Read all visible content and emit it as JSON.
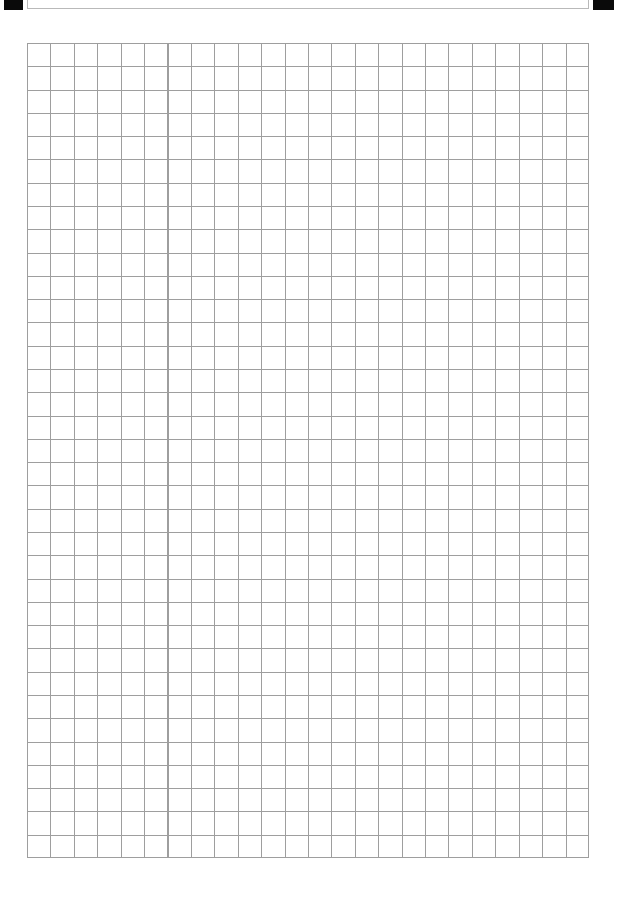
{
  "document": {
    "kind": "scanned-grid-worksheet",
    "page_background": "#ffffff",
    "width_px": 619,
    "height_px": 900
  },
  "fiducials": {
    "top_left": {
      "name": "registration-mark",
      "color": "#0a0a0a"
    },
    "top_right": {
      "name": "registration-mark",
      "color": "#0a0a0a"
    }
  },
  "header": {
    "title": "",
    "border_color": "#b9b9b9",
    "note": "header box clipped at top page edge; text illegible"
  },
  "grid": {
    "columns": 24,
    "rows": 35,
    "cell_width_px": 23.4,
    "cell_height_px": 23.3,
    "line_color": "#9e9e9e",
    "line_width_px": 1,
    "left_px": 27,
    "top_px": 43,
    "width_px": 562,
    "height_px": 815
  }
}
